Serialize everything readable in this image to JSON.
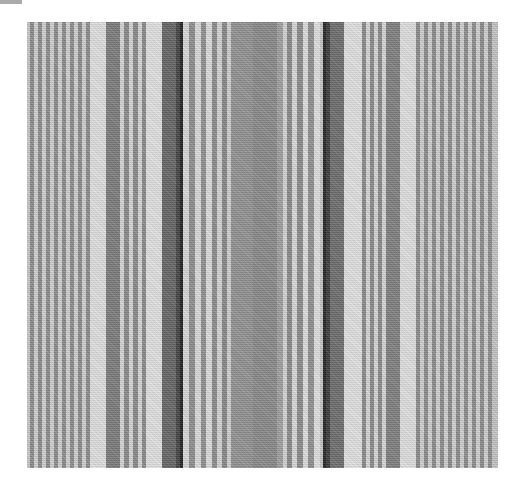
{
  "image": {
    "description": "Grayscale woven fabric with vertical stripes",
    "frame": {
      "x": 27,
      "y": 22,
      "width": 471,
      "height": 446
    },
    "stripes": [
      {
        "x": 0,
        "w": 3,
        "color": "#c8c8c8"
      },
      {
        "x": 3,
        "w": 4,
        "color": "#8c8c8c"
      },
      {
        "x": 7,
        "w": 4,
        "color": "#d0d0d0"
      },
      {
        "x": 11,
        "w": 4,
        "color": "#8c8c8c"
      },
      {
        "x": 15,
        "w": 4,
        "color": "#d0d0d0"
      },
      {
        "x": 19,
        "w": 4,
        "color": "#8c8c8c"
      },
      {
        "x": 23,
        "w": 4,
        "color": "#d0d0d0"
      },
      {
        "x": 27,
        "w": 4,
        "color": "#8c8c8c"
      },
      {
        "x": 31,
        "w": 4,
        "color": "#d0d0d0"
      },
      {
        "x": 35,
        "w": 4,
        "color": "#8c8c8c"
      },
      {
        "x": 39,
        "w": 4,
        "color": "#d0d0d0"
      },
      {
        "x": 43,
        "w": 4,
        "color": "#8c8c8c"
      },
      {
        "x": 47,
        "w": 4,
        "color": "#d0d0d0"
      },
      {
        "x": 51,
        "w": 4,
        "color": "#8c8c8c"
      },
      {
        "x": 55,
        "w": 4,
        "color": "#d0d0d0"
      },
      {
        "x": 59,
        "w": 4,
        "color": "#8c8c8c"
      },
      {
        "x": 63,
        "w": 16,
        "color": "#e0e0e0"
      },
      {
        "x": 79,
        "w": 14,
        "color": "#7c7c7c"
      },
      {
        "x": 93,
        "w": 4,
        "color": "#d6d6d6"
      },
      {
        "x": 97,
        "w": 5,
        "color": "#8a8a8a"
      },
      {
        "x": 102,
        "w": 4,
        "color": "#d6d6d6"
      },
      {
        "x": 106,
        "w": 5,
        "color": "#8a8a8a"
      },
      {
        "x": 111,
        "w": 4,
        "color": "#d6d6d6"
      },
      {
        "x": 115,
        "w": 4,
        "color": "#8a8a8a"
      },
      {
        "x": 119,
        "w": 16,
        "color": "#e2e2e2"
      },
      {
        "x": 135,
        "w": 14,
        "color": "#666666"
      },
      {
        "x": 149,
        "w": 4,
        "color": "#444444"
      },
      {
        "x": 153,
        "w": 3,
        "color": "#222222"
      },
      {
        "x": 156,
        "w": 6,
        "color": "#d8d8d8"
      },
      {
        "x": 162,
        "w": 6,
        "color": "#8e8e8e"
      },
      {
        "x": 168,
        "w": 6,
        "color": "#dadada"
      },
      {
        "x": 174,
        "w": 5,
        "color": "#909090"
      },
      {
        "x": 179,
        "w": 6,
        "color": "#dcdcdc"
      },
      {
        "x": 185,
        "w": 5,
        "color": "#8c8c8c"
      },
      {
        "x": 190,
        "w": 5,
        "color": "#d4d4d4"
      },
      {
        "x": 195,
        "w": 5,
        "color": "#888888"
      },
      {
        "x": 200,
        "w": 4,
        "color": "#cfcfcf"
      },
      {
        "x": 204,
        "w": 22,
        "color": "#929292"
      },
      {
        "x": 226,
        "w": 24,
        "color": "#8a8a8a"
      },
      {
        "x": 250,
        "w": 6,
        "color": "#a0a0a0"
      },
      {
        "x": 256,
        "w": 4,
        "color": "#d4d4d4"
      },
      {
        "x": 260,
        "w": 5,
        "color": "#8a8a8a"
      },
      {
        "x": 265,
        "w": 5,
        "color": "#d8d8d8"
      },
      {
        "x": 270,
        "w": 6,
        "color": "#8c8c8c"
      },
      {
        "x": 276,
        "w": 5,
        "color": "#dedede"
      },
      {
        "x": 281,
        "w": 6,
        "color": "#909090"
      },
      {
        "x": 287,
        "w": 6,
        "color": "#e0e0e0"
      },
      {
        "x": 293,
        "w": 3,
        "color": "#c6c6c6"
      },
      {
        "x": 296,
        "w": 3,
        "color": "#262626"
      },
      {
        "x": 299,
        "w": 4,
        "color": "#3c3c3c"
      },
      {
        "x": 303,
        "w": 14,
        "color": "#6e6e6e"
      },
      {
        "x": 317,
        "w": 18,
        "color": "#e2e2e2"
      },
      {
        "x": 335,
        "w": 4,
        "color": "#8a8a8a"
      },
      {
        "x": 339,
        "w": 4,
        "color": "#d6d6d6"
      },
      {
        "x": 343,
        "w": 4,
        "color": "#8a8a8a"
      },
      {
        "x": 347,
        "w": 4,
        "color": "#d6d6d6"
      },
      {
        "x": 351,
        "w": 4,
        "color": "#8a8a8a"
      },
      {
        "x": 355,
        "w": 4,
        "color": "#d6d6d6"
      },
      {
        "x": 359,
        "w": 14,
        "color": "#808080"
      },
      {
        "x": 373,
        "w": 16,
        "color": "#e0e0e0"
      },
      {
        "x": 389,
        "w": 4,
        "color": "#8c8c8c"
      },
      {
        "x": 393,
        "w": 4,
        "color": "#d0d0d0"
      },
      {
        "x": 397,
        "w": 4,
        "color": "#8c8c8c"
      },
      {
        "x": 401,
        "w": 4,
        "color": "#d0d0d0"
      },
      {
        "x": 405,
        "w": 4,
        "color": "#8c8c8c"
      },
      {
        "x": 409,
        "w": 4,
        "color": "#d0d0d0"
      },
      {
        "x": 413,
        "w": 4,
        "color": "#8c8c8c"
      },
      {
        "x": 417,
        "w": 4,
        "color": "#d0d0d0"
      },
      {
        "x": 421,
        "w": 4,
        "color": "#8c8c8c"
      },
      {
        "x": 425,
        "w": 4,
        "color": "#d0d0d0"
      },
      {
        "x": 429,
        "w": 4,
        "color": "#8c8c8c"
      },
      {
        "x": 433,
        "w": 4,
        "color": "#d0d0d0"
      },
      {
        "x": 437,
        "w": 4,
        "color": "#8c8c8c"
      },
      {
        "x": 441,
        "w": 4,
        "color": "#d0d0d0"
      },
      {
        "x": 445,
        "w": 4,
        "color": "#8c8c8c"
      },
      {
        "x": 449,
        "w": 4,
        "color": "#d0d0d0"
      },
      {
        "x": 453,
        "w": 4,
        "color": "#8c8c8c"
      },
      {
        "x": 457,
        "w": 4,
        "color": "#d0d0d0"
      },
      {
        "x": 461,
        "w": 4,
        "color": "#8c8c8c"
      },
      {
        "x": 465,
        "w": 6,
        "color": "#c4c4c4"
      }
    ]
  }
}
